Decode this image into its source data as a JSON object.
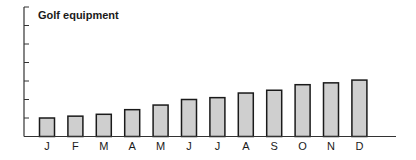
{
  "chart_data": {
    "type": "bar",
    "title": "Golf equipment",
    "xlabel": "",
    "ylabel": "",
    "categories": [
      "J",
      "F",
      "M",
      "A",
      "M",
      "J",
      "J",
      "A",
      "S",
      "O",
      "N",
      "D"
    ],
    "values": [
      1.0,
      1.1,
      1.2,
      1.45,
      1.7,
      2.0,
      2.1,
      2.35,
      2.5,
      2.8,
      2.9,
      3.05
    ],
    "ylim": [
      0,
      7
    ],
    "y_ticks": [
      1,
      2,
      3,
      4,
      5,
      6
    ],
    "y_tick_labels_shown": false,
    "grid": false,
    "legend": null,
    "colors": {
      "bar_fill": "#cfcfcf",
      "bar_stroke": "#1a1a1a",
      "axis": "#333333"
    }
  }
}
